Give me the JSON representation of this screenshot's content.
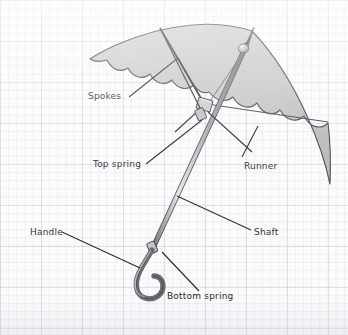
{
  "diagram": {
    "background": "graph-paper",
    "colors": {
      "paper": "#fbfbfc",
      "grid_line": "#a8b0be",
      "canopy_fill": "#c5c5c5",
      "canopy_shade": "#b0b0b0",
      "ink": "#2a2b30",
      "metal_light": "#d8d8d8",
      "metal_dark": "#55565c"
    },
    "labels": [
      {
        "id": "spokes",
        "text": "Spokes"
      },
      {
        "id": "top-spring",
        "text": "Top spring"
      },
      {
        "id": "runner",
        "text": "Runner"
      },
      {
        "id": "shaft",
        "text": "Shaft"
      },
      {
        "id": "handle",
        "text": "Handle"
      },
      {
        "id": "bottom-spring",
        "text": "Bottom spring"
      }
    ]
  }
}
